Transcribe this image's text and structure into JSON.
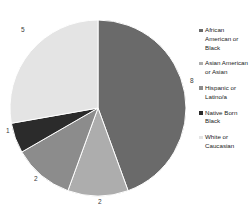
{
  "chart_data": {
    "type": "pie",
    "title": "",
    "labels": [
      "African American or Black",
      "Asian American or Asian",
      "Hispanic or Latino/a",
      "Native Born Black",
      "White or Caucasian"
    ],
    "values": [
      8,
      2,
      2,
      1,
      5
    ],
    "total": 18,
    "data_labels": [
      "8",
      "2",
      "2",
      "1",
      "5"
    ],
    "colors": [
      "#6a6a6a",
      "#adadad",
      "#8c8c8c",
      "#2b2b2b",
      "#e4e4e4"
    ],
    "start_angle_deg": 0,
    "direction": "clockwise",
    "legend_position": "right",
    "grid": false
  },
  "legend": {
    "items": [
      {
        "label": "African American or Black",
        "color": "#6a6a6a"
      },
      {
        "label": "Asian American or Asian",
        "color": "#adadad"
      },
      {
        "label": "Hispanic or Latino/a",
        "color": "#8c8c8c"
      },
      {
        "label": "Native Born Black",
        "color": "#2b2b2b"
      },
      {
        "label": "White or Caucasian",
        "color": "#e4e4e4"
      }
    ]
  },
  "slice_labels": [
    {
      "text": "8",
      "x": 190,
      "y": 78
    },
    {
      "text": "2",
      "x": 98,
      "y": 199
    },
    {
      "text": "2",
      "x": 34,
      "y": 176
    },
    {
      "text": "1",
      "x": 6,
      "y": 128
    },
    {
      "text": "5",
      "x": 21,
      "y": 27
    }
  ]
}
